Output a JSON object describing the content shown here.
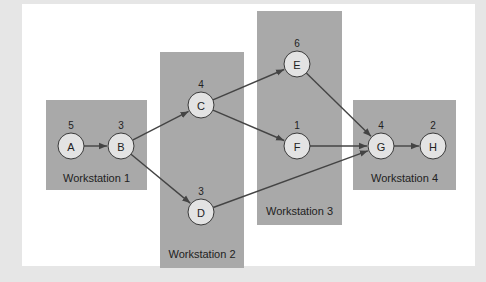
{
  "diagram": {
    "type": "precedence-network",
    "colors": {
      "background": "#e6e6e6",
      "panel": "#ffffff",
      "station": "#a9a9a9",
      "node_fill": "#e3e3e3",
      "edge": "#444444"
    },
    "stations": [
      {
        "id": "ws1",
        "label": "Workstation 1",
        "tasks": [
          "A",
          "B"
        ]
      },
      {
        "id": "ws2",
        "label": "Workstation 2",
        "tasks": [
          "C",
          "D"
        ]
      },
      {
        "id": "ws3",
        "label": "Workstation 3",
        "tasks": [
          "E",
          "F"
        ]
      },
      {
        "id": "ws4",
        "label": "Workstation 4",
        "tasks": [
          "G",
          "H"
        ]
      }
    ],
    "tasks": [
      {
        "id": "A",
        "label": "A",
        "time": "5"
      },
      {
        "id": "B",
        "label": "B",
        "time": "3"
      },
      {
        "id": "C",
        "label": "C",
        "time": "4"
      },
      {
        "id": "D",
        "label": "D",
        "time": "3"
      },
      {
        "id": "E",
        "label": "E",
        "time": "6"
      },
      {
        "id": "F",
        "label": "F",
        "time": "1"
      },
      {
        "id": "G",
        "label": "G",
        "time": "4"
      },
      {
        "id": "H",
        "label": "H",
        "time": "2"
      }
    ],
    "edges": [
      {
        "from": "A",
        "to": "B"
      },
      {
        "from": "B",
        "to": "C"
      },
      {
        "from": "B",
        "to": "D"
      },
      {
        "from": "C",
        "to": "E"
      },
      {
        "from": "C",
        "to": "F"
      },
      {
        "from": "E",
        "to": "G"
      },
      {
        "from": "F",
        "to": "G"
      },
      {
        "from": "D",
        "to": "G"
      },
      {
        "from": "G",
        "to": "H"
      }
    ]
  }
}
